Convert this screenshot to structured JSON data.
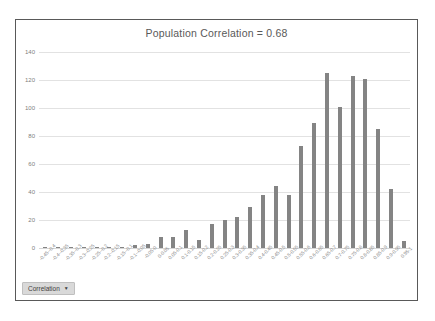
{
  "chart_data": {
    "type": "bar",
    "title": "Population Correlation = 0.68",
    "xlabel": "",
    "ylabel": "",
    "ylim": [
      0,
      140
    ],
    "yticks": [
      0,
      20,
      40,
      60,
      80,
      100,
      120,
      140
    ],
    "grid": true,
    "legend_position": "none",
    "series_name": "Correlation",
    "bar_color": "#848484",
    "categories": [
      "-0.45--0.4",
      "-0.4--0.35",
      "-0.35--0.3",
      "-0.3--0.25",
      "-0.25--0.2",
      "-0.2--0.15",
      "-0.15--0.1",
      "-0.1--0.05",
      "-0.05-0",
      "0-0.05",
      "0.05-0.1",
      "0.1-0.15",
      "0.15-0.2",
      "0.2-0.25",
      "0.25-0.3",
      "0.3-0.35",
      "0.35-0.4",
      "0.4-0.45",
      "0.45-0.5",
      "0.5-0.55",
      "0.55-0.6",
      "0.6-0.65",
      "0.65-0.7",
      "0.7-0.75",
      "0.75-0.8",
      "0.8-0.85",
      "0.85-0.9",
      "0.9-0.95",
      "0.95-1"
    ],
    "values": [
      1,
      1,
      1,
      1,
      1,
      1,
      1,
      2,
      3,
      8,
      8,
      13,
      6,
      17,
      20,
      22,
      29,
      38,
      44,
      38,
      73,
      89,
      125,
      101,
      123,
      121,
      85,
      42,
      5
    ]
  },
  "chart": {
    "title": "Population Correlation = 0.68"
  },
  "legend_filter": {
    "label": "Correlation",
    "caret": "▼"
  }
}
